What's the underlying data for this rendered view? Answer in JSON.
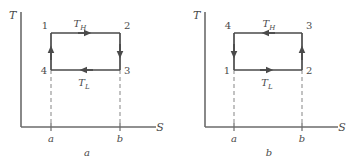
{
  "figure": {
    "type": "thermodynamic-cycle-ts-diagram",
    "panels": [
      {
        "id": "a",
        "caption": "a",
        "axes": {
          "y_label": "T",
          "x_label": "S"
        },
        "ticks": [
          {
            "label": "a"
          },
          {
            "label": "b"
          }
        ],
        "state_points": [
          {
            "label": "1",
            "position": "top-left"
          },
          {
            "label": "2",
            "position": "top-right"
          },
          {
            "label": "3",
            "position": "bottom-right"
          },
          {
            "label": "4",
            "position": "bottom-left"
          }
        ],
        "process_labels": [
          {
            "label": "T",
            "sub": "H",
            "edge": "top"
          },
          {
            "label": "T",
            "sub": "L",
            "edge": "bottom"
          }
        ],
        "arrows": [
          {
            "edge": "top",
            "direction": "right"
          },
          {
            "edge": "right",
            "direction": "down"
          },
          {
            "edge": "bottom",
            "direction": "left"
          },
          {
            "edge": "left",
            "direction": "up"
          }
        ],
        "cycle_direction": "clockwise"
      },
      {
        "id": "b",
        "caption": "b",
        "axes": {
          "y_label": "T",
          "x_label": "S"
        },
        "ticks": [
          {
            "label": "a"
          },
          {
            "label": "b"
          }
        ],
        "state_points": [
          {
            "label": "4",
            "position": "top-left"
          },
          {
            "label": "3",
            "position": "top-right"
          },
          {
            "label": "2",
            "position": "bottom-right"
          },
          {
            "label": "1",
            "position": "bottom-left"
          }
        ],
        "process_labels": [
          {
            "label": "T",
            "sub": "H",
            "edge": "top"
          },
          {
            "label": "T",
            "sub": "L",
            "edge": "bottom"
          }
        ],
        "arrows": [
          {
            "edge": "top",
            "direction": "left"
          },
          {
            "edge": "right",
            "direction": "up"
          },
          {
            "edge": "bottom",
            "direction": "right"
          },
          {
            "edge": "left",
            "direction": "down"
          }
        ],
        "cycle_direction": "counterclockwise"
      }
    ],
    "colors": {
      "line": "#4a4a4a",
      "axis": "#6b6b6b",
      "dashed": "#9a9a9a",
      "text": "#4a4a4a",
      "background": "#ffffff"
    }
  }
}
